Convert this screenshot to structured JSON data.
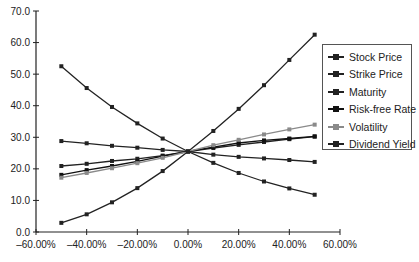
{
  "chart_data": {
    "type": "line",
    "title": "",
    "xlabel": "",
    "ylabel": "",
    "x": [
      -0.5,
      -0.4,
      -0.3,
      -0.2,
      -0.1,
      0.0,
      0.1,
      0.2,
      0.3,
      0.4,
      0.5
    ],
    "x_tick_labels": [
      "-60.00%",
      "-40.00%",
      "-20.00%",
      "0.00%",
      "20.00%",
      "40.00%",
      "60.00%"
    ],
    "x_ticks": [
      -0.6,
      -0.4,
      -0.2,
      0.0,
      0.2,
      0.4,
      0.6
    ],
    "xlim": [
      -0.6,
      0.6
    ],
    "y_tick_labels": [
      "0.0",
      "10.0",
      "20.0",
      "30.0",
      "40.0",
      "50.0",
      "60.0",
      "70.0"
    ],
    "y_ticks": [
      0,
      10,
      20,
      30,
      40,
      50,
      60,
      70
    ],
    "ylim": [
      0,
      70
    ],
    "grid": false,
    "legend_position": "right",
    "series": [
      {
        "name": "Stock Price",
        "color": "#222222",
        "values": [
          2.9,
          5.6,
          9.4,
          13.9,
          19.3,
          25.5,
          32.0,
          39.0,
          46.5,
          54.5,
          62.5
        ]
      },
      {
        "name": "Strike Price",
        "color": "#222222",
        "values": [
          52.5,
          45.6,
          39.6,
          34.4,
          29.6,
          25.5,
          21.9,
          18.7,
          16.0,
          13.8,
          11.8
        ]
      },
      {
        "name": "Maturity",
        "color": "#222222",
        "values": [
          20.9,
          21.6,
          22.5,
          23.2,
          24.2,
          25.5,
          26.6,
          27.6,
          28.5,
          29.4,
          30.2
        ]
      },
      {
        "name": "Risk-free Rate",
        "color": "#111111",
        "values": [
          18.1,
          19.6,
          20.9,
          22.4,
          24.0,
          25.5,
          26.9,
          28.2,
          29.0,
          29.6,
          30.3
        ]
      },
      {
        "name": "Volatility",
        "color": "#8a8a8a",
        "values": [
          17.2,
          18.7,
          20.2,
          21.8,
          23.5,
          25.5,
          27.5,
          29.2,
          30.9,
          32.5,
          34.0
        ]
      },
      {
        "name": "Dividend Yield",
        "color": "#222222",
        "values": [
          28.8,
          28.1,
          27.3,
          26.7,
          26.0,
          25.5,
          24.5,
          23.8,
          23.3,
          22.8,
          22.2
        ]
      }
    ]
  },
  "legend": {
    "items": [
      {
        "label": "Stock Price",
        "color": "#222222"
      },
      {
        "label": "Strike Price",
        "color": "#222222"
      },
      {
        "label": "Maturity",
        "color": "#222222"
      },
      {
        "label": "Risk-free Rate",
        "color": "#111111"
      },
      {
        "label": "Volatility",
        "color": "#8a8a8a"
      },
      {
        "label": "Dividend Yield",
        "color": "#222222"
      }
    ]
  }
}
